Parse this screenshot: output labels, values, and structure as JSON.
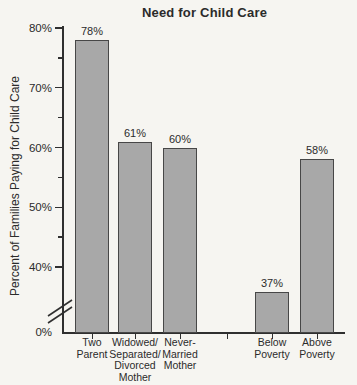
{
  "chart_data": {
    "type": "bar",
    "title": "Need for Child Care",
    "xlabel": "",
    "ylabel": "Percent of Families Paying for Child Care",
    "categories": [
      "Two Parent",
      "Widowed/Separated/Divorced Mother",
      "Never-Married Mother",
      "Below Poverty",
      "Above Poverty"
    ],
    "category_lines": [
      [
        "Two",
        "Parent"
      ],
      [
        "Widowed/",
        "Separated/",
        "Divorced",
        "Mother"
      ],
      [
        "Never-",
        "Married",
        "Mother"
      ],
      [
        "Below",
        "Poverty"
      ],
      [
        "Above",
        "Poverty"
      ]
    ],
    "values": [
      78,
      61,
      60,
      37,
      58
    ],
    "bar_labels": [
      "78%",
      "61%",
      "60%",
      "37%",
      "58%"
    ],
    "y_ticks_major": [
      80,
      70,
      60,
      50,
      40,
      0
    ],
    "y_tick_labels": [
      "80%",
      "70%",
      "60%",
      "50%",
      "40%",
      "0%"
    ],
    "y_ticks_minor": [
      75,
      65,
      55,
      45
    ],
    "ylim": [
      0,
      80
    ],
    "axis_break": true,
    "axis_break_between": [
      0,
      40
    ],
    "grid": false,
    "legend": false,
    "group_gap_after_index": 2,
    "colors": {
      "bar_fill": "#a8a8a8",
      "bar_border": "#474747",
      "axis": "#2f2f2f",
      "text": "#2b2b2b",
      "background": "#f6f5f1"
    }
  }
}
